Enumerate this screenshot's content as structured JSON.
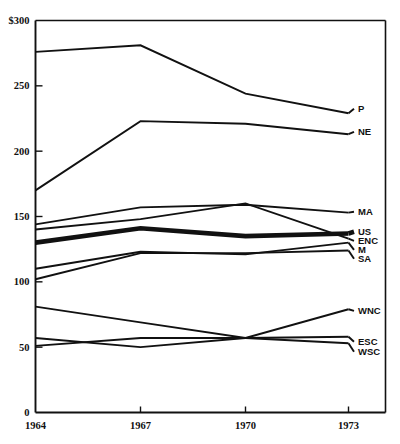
{
  "chart_data": {
    "type": "line",
    "title": "",
    "subtitle": "",
    "xlabel": "",
    "ylabel": "",
    "x": [
      1964,
      1967,
      1970,
      1973
    ],
    "categories": [
      "1964",
      "1967",
      "1970",
      "1973"
    ],
    "xlim": [
      1964,
      1973
    ],
    "ylim": [
      0,
      300
    ],
    "yticks": [
      0,
      50,
      100,
      150,
      200,
      250,
      300
    ],
    "ytick_labels": [
      "0",
      "50",
      "100",
      "150",
      "200",
      "250",
      "$300"
    ],
    "xtick_labels": [
      "1964",
      "1967",
      "1970",
      "1973"
    ],
    "grid": false,
    "legend_position": "right-inline-labels",
    "series": [
      {
        "name": "P",
        "label": "P",
        "values": [
          276,
          281,
          244,
          229
        ],
        "emphasis": false
      },
      {
        "name": "NE",
        "label": "NE",
        "values": [
          170,
          223,
          221,
          213
        ],
        "emphasis": false
      },
      {
        "name": "MA",
        "label": "MA",
        "values": [
          144,
          157,
          159,
          153
        ],
        "emphasis": false
      },
      {
        "name": "US",
        "label": "US",
        "values": [
          130,
          141,
          135,
          137
        ],
        "emphasis": true
      },
      {
        "name": "ENC",
        "label": "ENC",
        "values": [
          140,
          148,
          160,
          133
        ],
        "emphasis": false
      },
      {
        "name": "M",
        "label": "M",
        "values": [
          110,
          123,
          121,
          130
        ],
        "emphasis": false
      },
      {
        "name": "SA",
        "label": "SA",
        "values": [
          102,
          122,
          122,
          124
        ],
        "emphasis": false
      },
      {
        "name": "WNC",
        "label": "WNC",
        "values": [
          81,
          69,
          57,
          79
        ],
        "emphasis": false
      },
      {
        "name": "ESC",
        "label": "ESC",
        "values": [
          57,
          50,
          57,
          58
        ],
        "emphasis": false
      },
      {
        "name": "WSC",
        "label": "WSC",
        "values": [
          51,
          57,
          57,
          53
        ],
        "emphasis": false
      }
    ]
  },
  "chart": {
    "currency_prefix": "$",
    "y_axis": {
      "ticks": [
        {
          "value": 300,
          "label": "$300"
        },
        {
          "value": 250,
          "label": "250"
        },
        {
          "value": 200,
          "label": "200"
        },
        {
          "value": 150,
          "label": "150"
        },
        {
          "value": 100,
          "label": "100"
        },
        {
          "value": 50,
          "label": "50"
        },
        {
          "value": 0,
          "label": "0"
        }
      ]
    },
    "x_axis": {
      "ticks": [
        {
          "value": 1964,
          "label": "1964"
        },
        {
          "value": 1967,
          "label": "1967"
        },
        {
          "value": 1970,
          "label": "1970"
        },
        {
          "value": 1973,
          "label": "1973"
        }
      ]
    },
    "series_labels": [
      "P",
      "NE",
      "MA",
      "US",
      "ENC",
      "M",
      "SA",
      "WNC",
      "ESC",
      "WSC"
    ]
  }
}
